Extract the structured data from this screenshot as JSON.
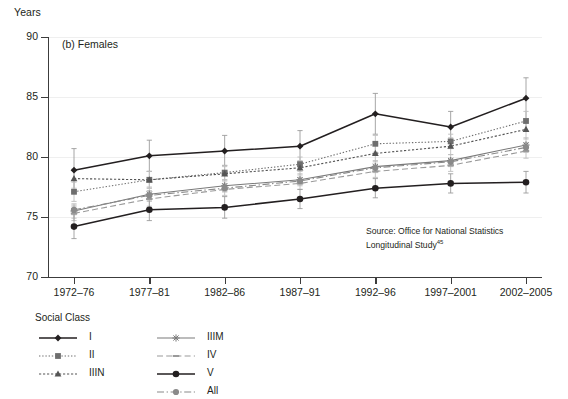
{
  "axis": {
    "ylabel": "Years",
    "yticks": [
      "90",
      "85",
      "80",
      "75",
      "70"
    ],
    "xticks": [
      "1972–76",
      "1977–81",
      "1982–86",
      "1987–91",
      "1992–96",
      "1997–2001",
      "2002–2005"
    ]
  },
  "panel": {
    "title": "(b) Females"
  },
  "source": {
    "line1": "Source: Office for National Statistics",
    "line2": "Longitudinal Study",
    "ref": "45"
  },
  "legend": {
    "title": "Social Class",
    "items": [
      {
        "label": "I",
        "col": 0,
        "row": 0
      },
      {
        "label": "II",
        "col": 0,
        "row": 1
      },
      {
        "label": "IIIN",
        "col": 0,
        "row": 2
      },
      {
        "label": "IIIM",
        "col": 1,
        "row": 0
      },
      {
        "label": "IV",
        "col": 1,
        "row": 1
      },
      {
        "label": "V",
        "col": 1,
        "row": 2
      },
      {
        "label": "All",
        "col": 1,
        "row": 3
      }
    ]
  },
  "chart_data": {
    "type": "line",
    "title": "(b) Females",
    "xlabel": "",
    "ylabel": "Years",
    "ylim": [
      70,
      90
    ],
    "yticks": [
      70,
      75,
      80,
      85,
      90
    ],
    "grid": true,
    "legend_position": "below-left",
    "categories": [
      "1972–76",
      "1977–81",
      "1982–86",
      "1987–91",
      "1992–96",
      "1997–2001",
      "2002–2005"
    ],
    "series": [
      {
        "name": "I",
        "color": "#231f20",
        "marker": "diamond",
        "dash": "solid",
        "values": [
          78.9,
          80.1,
          80.5,
          80.9,
          83.6,
          82.5,
          84.9
        ],
        "err_low": [
          77.1,
          78.8,
          79.3,
          79.6,
          81.9,
          81.2,
          83.2
        ],
        "err_high": [
          80.7,
          81.4,
          81.8,
          82.2,
          85.3,
          83.8,
          86.6
        ]
      },
      {
        "name": "II",
        "color": "#6e6e6e",
        "marker": "square",
        "dash": "dotted",
        "values": [
          77.1,
          78.1,
          78.7,
          79.4,
          81.1,
          81.3,
          83.0
        ],
        "err_low": [
          76.3,
          77.4,
          78.1,
          78.8,
          80.4,
          80.7,
          82.2
        ],
        "err_high": [
          77.9,
          78.8,
          79.3,
          80.0,
          81.8,
          81.9,
          83.8
        ]
      },
      {
        "name": "IIIN",
        "color": "#555555",
        "marker": "triangle",
        "dash": "dashed-fine",
        "values": [
          78.2,
          78.1,
          78.6,
          79.1,
          80.3,
          80.9,
          82.3
        ],
        "err_low": [
          77.4,
          77.4,
          78.0,
          78.5,
          79.6,
          80.2,
          81.5
        ],
        "err_high": [
          79.0,
          78.8,
          79.2,
          79.7,
          81.0,
          81.6,
          83.1
        ]
      },
      {
        "name": "IIIM",
        "color": "#7a7a7a",
        "marker": "star",
        "dash": "solid",
        "values": [
          75.5,
          76.9,
          77.6,
          78.1,
          79.2,
          79.7,
          81.0
        ],
        "err_low": [
          74.9,
          76.3,
          77.1,
          77.6,
          78.7,
          79.2,
          80.4
        ],
        "err_high": [
          76.1,
          77.5,
          78.1,
          78.6,
          79.7,
          80.2,
          81.6
        ]
      },
      {
        "name": "IV",
        "color": "#9a9a9a",
        "marker": "dash",
        "dash": "long-dash",
        "values": [
          75.3,
          76.5,
          77.3,
          77.8,
          78.8,
          79.3,
          80.5
        ],
        "err_low": [
          74.7,
          75.9,
          76.8,
          77.3,
          78.3,
          78.8,
          79.9
        ],
        "err_high": [
          75.9,
          77.1,
          77.8,
          78.3,
          79.3,
          79.8,
          81.1
        ]
      },
      {
        "name": "V",
        "color": "#231f20",
        "marker": "circle",
        "dash": "solid",
        "values": [
          74.2,
          75.6,
          75.8,
          76.5,
          77.4,
          77.8,
          77.9
        ],
        "err_low": [
          73.2,
          74.7,
          74.9,
          75.7,
          76.6,
          77.0,
          77.0
        ],
        "err_high": [
          75.2,
          76.5,
          76.7,
          77.3,
          78.2,
          78.6,
          78.8
        ]
      },
      {
        "name": "All",
        "color": "#8a8a8a",
        "marker": "circle-grey",
        "dash": "dash-dot",
        "values": [
          75.6,
          76.8,
          77.4,
          78.0,
          79.1,
          79.6,
          80.8
        ],
        "err_low": [
          75.2,
          76.4,
          77.1,
          77.7,
          78.8,
          79.3,
          80.4
        ],
        "err_high": [
          76.0,
          77.2,
          77.7,
          78.3,
          79.4,
          79.9,
          81.2
        ]
      }
    ]
  }
}
